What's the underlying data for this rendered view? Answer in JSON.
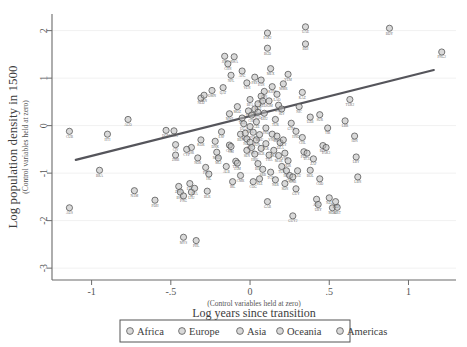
{
  "chart_data": {
    "type": "scatter",
    "title": "",
    "xlabel": "Log years since transition",
    "xlabel_sub": "(Control variables held at zero)",
    "ylabel": "Log population density in 1500",
    "ylabel_sub": "(Control variables held at zero)",
    "xlim": [
      -1.25,
      1.3
    ],
    "ylim": [
      -3.25,
      2.35
    ],
    "xticks": [
      -1,
      -0.5,
      0,
      0.5,
      1
    ],
    "xticklabels": [
      "-1",
      "-.5",
      "0",
      ".5",
      "1"
    ],
    "yticks": [
      2,
      1,
      0,
      -1,
      -2,
      -3
    ],
    "yticklabels": [
      "2",
      "1",
      "0",
      "-1",
      "-2",
      "-3"
    ],
    "grid": "horizontal",
    "legend_position": "bottom",
    "fit_line": {
      "x0": -1.1,
      "y0": -0.72,
      "x1": 1.16,
      "y1": 1.17,
      "color": "#55555b"
    },
    "legend": [
      {
        "label": "Africa",
        "key": "africa",
        "color": "#c2c2c2"
      },
      {
        "label": "Europe",
        "key": "europe",
        "color": "#b5b5b5"
      },
      {
        "label": "Asia",
        "key": "asia",
        "color": "#bdbdbd"
      },
      {
        "label": "Oceania",
        "key": "oceania",
        "color": "#9e9e9e"
      },
      {
        "label": "Americas",
        "key": "americas",
        "color": "#a8a8a8"
      }
    ],
    "points": [
      {
        "x": -1.14,
        "y": -0.12,
        "label": "CUB",
        "g": "americas"
      },
      {
        "x": -1.14,
        "y": -1.73,
        "label": "AUS",
        "g": "oceania"
      },
      {
        "x": -0.95,
        "y": -0.94,
        "label": "BRA",
        "g": "americas"
      },
      {
        "x": -0.9,
        "y": -0.18,
        "label": "HTI",
        "g": "americas"
      },
      {
        "x": -0.77,
        "y": 0.13,
        "label": "AGO",
        "g": "africa"
      },
      {
        "x": -0.73,
        "y": -1.37,
        "label": "NAM",
        "g": "africa"
      },
      {
        "x": -0.6,
        "y": -1.57,
        "label": "PDH",
        "g": "africa"
      },
      {
        "x": -0.53,
        "y": -0.1,
        "label": "DOM",
        "g": "americas"
      },
      {
        "x": -0.48,
        "y": -0.11,
        "label": "GHA",
        "g": "africa"
      },
      {
        "x": -0.47,
        "y": -0.4,
        "label": "CIV",
        "g": "africa"
      },
      {
        "x": -0.47,
        "y": -0.62,
        "label": "ZMB",
        "g": "africa"
      },
      {
        "x": -0.45,
        "y": -1.28,
        "label": "ZWE",
        "g": "africa"
      },
      {
        "x": -0.44,
        "y": -1.4,
        "label": "BWA",
        "g": "africa"
      },
      {
        "x": -0.42,
        "y": -1.48,
        "label": "PNG",
        "g": "oceania"
      },
      {
        "x": -0.42,
        "y": -2.35,
        "label": "MYS",
        "g": "asia"
      },
      {
        "x": -0.38,
        "y": -1.22,
        "label": "EST",
        "g": "europe"
      },
      {
        "x": -0.37,
        "y": -1.4,
        "label": "LTU",
        "g": "europe"
      },
      {
        "x": -0.35,
        "y": -1.32,
        "label": "LVA",
        "g": "europe"
      },
      {
        "x": -0.34,
        "y": -2.42,
        "label": "PHL",
        "g": "asia"
      },
      {
        "x": -0.31,
        "y": -0.3,
        "label": "KOR",
        "g": "asia"
      },
      {
        "x": -0.31,
        "y": 0.58,
        "label": "NLD",
        "g": "europe"
      },
      {
        "x": -0.29,
        "y": 0.64,
        "label": "IRN",
        "g": "asia"
      },
      {
        "x": -0.27,
        "y": -1.38,
        "label": "BLR",
        "g": "europe"
      },
      {
        "x": -0.22,
        "y": -0.33,
        "label": "DNK",
        "g": "europe"
      },
      {
        "x": -0.21,
        "y": -0.56,
        "label": "MKD",
        "g": "europe"
      },
      {
        "x": -0.18,
        "y": -0.13,
        "label": "ESP",
        "g": "europe"
      },
      {
        "x": -0.16,
        "y": 1.46,
        "label": "JPN",
        "g": "asia"
      },
      {
        "x": -0.14,
        "y": 1.3,
        "label": "CHN",
        "g": "asia"
      },
      {
        "x": -0.13,
        "y": -0.41,
        "label": "COL",
        "g": "americas"
      },
      {
        "x": -0.12,
        "y": -0.44,
        "label": "CRI",
        "g": "americas"
      },
      {
        "x": -0.12,
        "y": 1.06,
        "label": "NPL",
        "g": "asia"
      },
      {
        "x": -0.1,
        "y": 1.45,
        "label": "RWA",
        "g": "africa"
      },
      {
        "x": -0.09,
        "y": -0.75,
        "label": "TTO",
        "g": "americas"
      },
      {
        "x": -0.08,
        "y": -0.79,
        "label": "JAM",
        "g": "americas"
      },
      {
        "x": -0.06,
        "y": -0.18,
        "label": "BEN",
        "g": "africa"
      },
      {
        "x": -0.05,
        "y": 0.16,
        "label": "TZA",
        "g": "africa"
      },
      {
        "x": -0.04,
        "y": 0.04,
        "label": "UGA",
        "g": "africa"
      },
      {
        "x": -0.03,
        "y": -0.16,
        "label": "KEN",
        "g": "africa"
      },
      {
        "x": -0.02,
        "y": -0.28,
        "label": "NGA",
        "g": "africa"
      },
      {
        "x": -0.02,
        "y": -0.52,
        "label": "SEN",
        "g": "africa"
      },
      {
        "x": -0.01,
        "y": 0.31,
        "label": "ITA",
        "g": "europe"
      },
      {
        "x": 0.0,
        "y": -0.02,
        "label": "FRA",
        "g": "europe"
      },
      {
        "x": 0.0,
        "y": -0.35,
        "label": "PRT",
        "g": "europe"
      },
      {
        "x": 0.01,
        "y": 0.22,
        "label": "CHE",
        "g": "europe"
      },
      {
        "x": 0.01,
        "y": -0.46,
        "label": "SVK",
        "g": "europe"
      },
      {
        "x": 0.02,
        "y": -0.14,
        "label": "POL",
        "g": "europe"
      },
      {
        "x": 0.03,
        "y": 0.35,
        "label": "GBR",
        "g": "europe"
      },
      {
        "x": 0.03,
        "y": -0.6,
        "label": "HRV",
        "g": "europe"
      },
      {
        "x": 0.04,
        "y": 0.08,
        "label": "CZE",
        "g": "europe"
      },
      {
        "x": 0.04,
        "y": -0.3,
        "label": "HUN",
        "g": "europe"
      },
      {
        "x": 0.05,
        "y": 0.46,
        "label": "SWE",
        "g": "europe"
      },
      {
        "x": 0.05,
        "y": -0.8,
        "label": "BIH",
        "g": "europe"
      },
      {
        "x": 0.06,
        "y": -0.19,
        "label": "ROU",
        "g": "europe"
      },
      {
        "x": 0.07,
        "y": 0.62,
        "label": "AUT",
        "g": "europe"
      },
      {
        "x": 0.07,
        "y": -0.48,
        "label": "BGR",
        "g": "europe"
      },
      {
        "x": 0.08,
        "y": 0.52,
        "label": "BEL",
        "g": "europe"
      },
      {
        "x": 0.08,
        "y": -0.92,
        "label": "SRB",
        "g": "europe"
      },
      {
        "x": 0.09,
        "y": 0.26,
        "label": "DEU",
        "g": "europe"
      },
      {
        "x": 0.1,
        "y": -0.05,
        "label": "IND",
        "g": "asia"
      },
      {
        "x": 0.1,
        "y": -0.38,
        "label": "PAK",
        "g": "asia"
      },
      {
        "x": 0.11,
        "y": 1.95,
        "label": "PAK2",
        "g": "asia"
      },
      {
        "x": 0.11,
        "y": 1.63,
        "label": "BGD",
        "g": "asia"
      },
      {
        "x": 0.12,
        "y": -0.62,
        "label": "THA",
        "g": "asia"
      },
      {
        "x": 0.13,
        "y": 1.2,
        "label": "MEX",
        "g": "americas"
      },
      {
        "x": 0.14,
        "y": -0.18,
        "label": "VNM",
        "g": "asia"
      },
      {
        "x": 0.15,
        "y": -0.52,
        "label": "LKA",
        "g": "asia"
      },
      {
        "x": 0.16,
        "y": 0.13,
        "label": "TUR",
        "g": "asia"
      },
      {
        "x": 0.17,
        "y": -0.22,
        "label": "GRC",
        "g": "europe"
      },
      {
        "x": 0.18,
        "y": -0.63,
        "label": "MAR",
        "g": "africa"
      },
      {
        "x": 0.19,
        "y": -0.36,
        "label": "DZA",
        "g": "africa"
      },
      {
        "x": 0.2,
        "y": -0.86,
        "label": "TUN",
        "g": "africa"
      },
      {
        "x": 0.21,
        "y": -0.3,
        "label": "EGY",
        "g": "africa"
      },
      {
        "x": 0.22,
        "y": -0.58,
        "label": "SYR",
        "g": "asia"
      },
      {
        "x": 0.23,
        "y": -0.95,
        "label": "IRQ",
        "g": "asia"
      },
      {
        "x": 0.24,
        "y": -0.74,
        "label": "JOR",
        "g": "asia"
      },
      {
        "x": 0.25,
        "y": -1.05,
        "label": "GMB",
        "g": "africa"
      },
      {
        "x": 0.27,
        "y": -1.08,
        "label": "GNB",
        "g": "africa"
      },
      {
        "x": 0.29,
        "y": -1.33,
        "label": "GUY",
        "g": "americas"
      },
      {
        "x": 0.3,
        "y": -0.95,
        "label": "SAU",
        "g": "asia"
      },
      {
        "x": 0.33,
        "y": -0.25,
        "label": "CHL",
        "g": "americas"
      },
      {
        "x": 0.34,
        "y": -0.55,
        "label": "PER",
        "g": "americas"
      },
      {
        "x": 0.36,
        "y": -0.58,
        "label": "ECU",
        "g": "americas"
      },
      {
        "x": 0.38,
        "y": -0.94,
        "label": "BOL",
        "g": "americas"
      },
      {
        "x": 0.42,
        "y": -1.55,
        "label": "ARG",
        "g": "americas"
      },
      {
        "x": 0.43,
        "y": -1.66,
        "label": "URY",
        "g": "americas"
      },
      {
        "x": 0.5,
        "y": -1.52,
        "label": "NZL",
        "g": "oceania"
      },
      {
        "x": 0.52,
        "y": -1.73,
        "label": "MDG",
        "g": "africa"
      },
      {
        "x": 0.55,
        "y": -1.72,
        "label": "MRT",
        "g": "africa"
      },
      {
        "x": 0.54,
        "y": -1.6,
        "label": "NZ2",
        "g": "oceania"
      },
      {
        "x": 0.35,
        "y": 2.08,
        "label": "UAE",
        "g": "asia"
      },
      {
        "x": 0.35,
        "y": 1.72,
        "label": "BDI",
        "g": "africa"
      },
      {
        "x": 0.88,
        "y": 2.05,
        "label": "BDY",
        "g": "asia"
      },
      {
        "x": 0.63,
        "y": 0.55,
        "label": "TUR2",
        "g": "asia"
      },
      {
        "x": 0.6,
        "y": 0.1,
        "label": "LBR",
        "g": "africa"
      },
      {
        "x": 0.66,
        "y": -0.22,
        "label": "IDN",
        "g": "asia"
      },
      {
        "x": 0.67,
        "y": -0.66,
        "label": "LBY",
        "g": "africa"
      },
      {
        "x": 0.68,
        "y": -1.08,
        "label": "LBN",
        "g": "asia"
      },
      {
        "x": 1.21,
        "y": 1.55,
        "label": "PNG2",
        "g": "oceania"
      },
      {
        "x": 0.44,
        "y": 0.23,
        "label": "SUR",
        "g": "americas"
      },
      {
        "x": 0.49,
        "y": -0.05,
        "label": "TIB",
        "g": "asia"
      },
      {
        "x": 0.27,
        "y": -1.9,
        "label": "GUY2",
        "g": "americas"
      },
      {
        "x": 0.46,
        "y": -0.42,
        "label": "REF",
        "g": "asia"
      },
      {
        "x": 0.48,
        "y": -0.46,
        "label": "PAK3",
        "g": "asia"
      },
      {
        "x": -0.37,
        "y": -0.46,
        "label": "ISR",
        "g": "asia"
      },
      {
        "x": -0.4,
        "y": -0.5,
        "label": "CYP",
        "g": "europe"
      },
      {
        "x": -0.2,
        "y": -0.68,
        "label": "MLI",
        "g": "africa"
      },
      {
        "x": 0.06,
        "y": -1.12,
        "label": "SLE",
        "g": "africa"
      },
      {
        "x": 0.02,
        "y": -1.18,
        "label": "COG",
        "g": "africa"
      },
      {
        "x": -0.06,
        "y": -1.05,
        "label": "CMR",
        "g": "africa"
      },
      {
        "x": 0.13,
        "y": -0.98,
        "label": "TCD",
        "g": "africa"
      },
      {
        "x": 0.16,
        "y": -1.14,
        "label": "NER",
        "g": "africa"
      },
      {
        "x": 0.22,
        "y": -1.22,
        "label": "SDN",
        "g": "africa"
      },
      {
        "x": 0.18,
        "y": 0.43,
        "label": "ETH",
        "g": "africa"
      },
      {
        "x": 0.12,
        "y": 0.52,
        "label": "SOM",
        "g": "africa"
      },
      {
        "x": -0.08,
        "y": 0.4,
        "label": "MOZ",
        "g": "africa"
      },
      {
        "x": -0.13,
        "y": 0.25,
        "label": "MWI",
        "g": "africa"
      },
      {
        "x": 0.0,
        "y": 0.55,
        "label": "BFA",
        "g": "africa"
      },
      {
        "x": 0.05,
        "y": 0.28,
        "label": "TGO",
        "g": "africa"
      },
      {
        "x": 0.09,
        "y": 0.72,
        "label": "GIN",
        "g": "africa"
      },
      {
        "x": 0.2,
        "y": 0.35,
        "label": "SLV",
        "g": "americas"
      },
      {
        "x": 0.26,
        "y": 0.05,
        "label": "GTM",
        "g": "americas"
      },
      {
        "x": 0.29,
        "y": -0.12,
        "label": "HND",
        "g": "americas"
      },
      {
        "x": 0.31,
        "y": 0.4,
        "label": "NIC",
        "g": "americas"
      },
      {
        "x": -0.02,
        "y": 0.9,
        "label": "VEN",
        "g": "americas"
      },
      {
        "x": 0.03,
        "y": 1.02,
        "label": "PRY",
        "g": "americas"
      },
      {
        "x": 0.07,
        "y": 0.96,
        "label": "PAN",
        "g": "americas"
      },
      {
        "x": 0.14,
        "y": 0.82,
        "label": "KHM",
        "g": "asia"
      },
      {
        "x": 0.17,
        "y": 0.66,
        "label": "LAO",
        "g": "asia"
      },
      {
        "x": 0.21,
        "y": 0.88,
        "label": "MMR",
        "g": "asia"
      },
      {
        "x": -0.05,
        "y": 1.15,
        "label": "AFG",
        "g": "asia"
      },
      {
        "x": 0.24,
        "y": 1.08,
        "label": "YEM",
        "g": "asia"
      },
      {
        "x": -0.24,
        "y": 0.74,
        "label": "OMN",
        "g": "asia"
      },
      {
        "x": -0.17,
        "y": 0.8,
        "label": "QAT",
        "g": "asia"
      },
      {
        "x": 0.33,
        "y": 0.7,
        "label": "KAZ",
        "g": "asia"
      },
      {
        "x": 0.38,
        "y": 0.18,
        "label": "UZB",
        "g": "asia"
      },
      {
        "x": -0.28,
        "y": -0.88,
        "label": "FIN",
        "g": "europe"
      },
      {
        "x": -0.33,
        "y": -0.68,
        "label": "NOR",
        "g": "europe"
      },
      {
        "x": -0.26,
        "y": -1.02,
        "label": "ISL",
        "g": "europe"
      },
      {
        "x": -0.11,
        "y": -1.18,
        "label": "IRL",
        "g": "europe"
      },
      {
        "x": -0.15,
        "y": -0.86,
        "label": "ALB",
        "g": "europe"
      },
      {
        "x": 0.4,
        "y": -0.7,
        "label": "ZAF",
        "g": "africa"
      },
      {
        "x": 0.44,
        "y": -1.12,
        "label": "COD",
        "g": "africa"
      },
      {
        "x": 0.11,
        "y": -1.6,
        "label": "GAB",
        "g": "africa"
      }
    ]
  }
}
